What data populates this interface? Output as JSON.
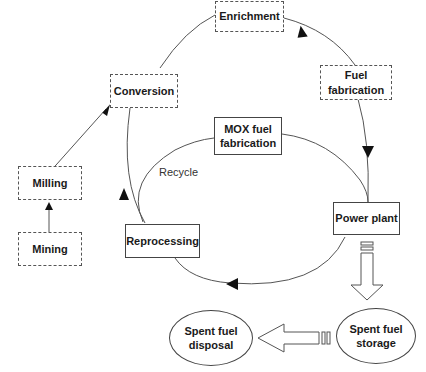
{
  "diagram": {
    "nodes": {
      "enrichment": {
        "label": "Enrichment",
        "style": "dashed"
      },
      "fuel_fabrication": {
        "label": "Fuel fabrication",
        "line1": "Fuel",
        "line2": "fabrication",
        "style": "dashed"
      },
      "conversion": {
        "label": "Conversion",
        "style": "dashed"
      },
      "milling": {
        "label": "Milling",
        "style": "dashed"
      },
      "mining": {
        "label": "Mining",
        "style": "dashed"
      },
      "mox_fuel_fabrication": {
        "label": "MOX fuel fabrication",
        "line1": "MOX fuel",
        "line2": "fabrication",
        "style": "solid"
      },
      "power_plant": {
        "label": "Power plant",
        "style": "solid"
      },
      "reprocessing": {
        "label": "Reprocessing",
        "style": "solid"
      },
      "spent_fuel_storage": {
        "label": "Spent fuel storage",
        "line1": "Spent fuel",
        "line2": "storage",
        "style": "ellipse"
      },
      "spent_fuel_disposal": {
        "label": "Spent fuel disposal",
        "line1": "Spent fuel",
        "line2": "disposal",
        "style": "ellipse"
      }
    },
    "annotations": {
      "recycle": "Recycle"
    },
    "edges": [
      {
        "from": "Mining",
        "to": "Milling"
      },
      {
        "from": "Milling",
        "to": "Conversion"
      },
      {
        "from": "Conversion",
        "to": "Enrichment"
      },
      {
        "from": "Enrichment",
        "to": "Fuel fabrication"
      },
      {
        "from": "Fuel fabrication",
        "to": "Power plant"
      },
      {
        "from": "Power plant",
        "to": "Reprocessing"
      },
      {
        "from": "Reprocessing",
        "to": "Conversion"
      },
      {
        "from": "Reprocessing",
        "to": "MOX fuel fabrication"
      },
      {
        "from": "MOX fuel fabrication",
        "to": "Power plant"
      },
      {
        "from": "Power plant",
        "to": "Spent fuel storage"
      },
      {
        "from": "Spent fuel storage",
        "to": "Spent fuel disposal"
      }
    ],
    "colors": {
      "line": "#555555",
      "arrowhead": "#111111",
      "text": "#1a1a1a"
    }
  }
}
